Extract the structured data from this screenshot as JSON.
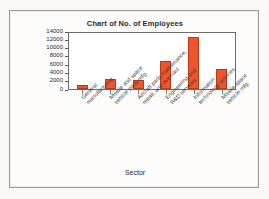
{
  "chart_data": {
    "type": "bar",
    "title": "Chart of No. of Employees",
    "xlabel": "Sector",
    "ylabel": "No. of employees",
    "categories": [
      "General manufacturing",
      "Missile and space vehicle parts mfg.",
      "Aircraft parts maintenance, repair, and overhaul",
      "Engineering and R&D services",
      "Information technology services",
      "Missile space vehicle mfg."
    ],
    "category_lines": [
      [
        "General",
        "manufacturing"
      ],
      [
        "Missile and space",
        "vehicle parts mfg."
      ],
      [
        "Aircraft parts maintenance,",
        "repair, and overhaul"
      ],
      [
        "Engineering and",
        "R&D services"
      ],
      [
        "Information",
        "technology services"
      ],
      [
        "Missile space",
        "vehicle mfg."
      ]
    ],
    "values": [
      1000,
      2400,
      2200,
      6700,
      12500,
      4800
    ],
    "ylim": [
      0,
      14000
    ],
    "yticks": [
      0,
      2000,
      4000,
      6000,
      8000,
      10000,
      12000,
      14000
    ],
    "ytick_labels": [
      "0",
      "2000",
      "4000",
      "6000",
      "8000",
      "10000",
      "12000",
      "14000"
    ],
    "grid": false,
    "legend": false,
    "bar_color": "#f0542a",
    "bar_edge_color": "#b93a17",
    "plot_bg": "#ffffff",
    "axis_color": "#6b6b6b"
  }
}
